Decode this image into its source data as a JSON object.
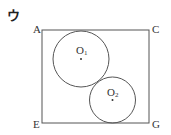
{
  "figure": {
    "label": "ウ",
    "rectangle": {
      "x": 42,
      "y": 30,
      "width": 107,
      "height": 93,
      "stroke": "#555555"
    },
    "vertices": {
      "top_left": "A",
      "top_right": "C",
      "bottom_left": "E",
      "bottom_right": "G"
    },
    "circles": [
      {
        "name": "O1",
        "label_main": "O",
        "label_sub": "1",
        "cx": 81,
        "cy": 59,
        "r": 28
      },
      {
        "name": "O2",
        "label_main": "O",
        "label_sub": "2",
        "cx": 112.5,
        "cy": 100,
        "r": 23
      }
    ],
    "colors": {
      "stroke": "#555555",
      "text": "#333333",
      "background": "#ffffff"
    }
  }
}
